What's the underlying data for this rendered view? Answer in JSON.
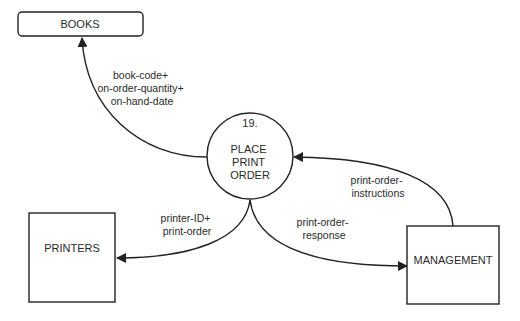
{
  "diagram": {
    "type": "data-flow-diagram",
    "process": {
      "number": "19.",
      "label_lines": [
        "PLACE",
        "PRINT",
        "ORDER"
      ]
    },
    "data_stores": [
      {
        "id": "books",
        "label": "BOOKS"
      }
    ],
    "external_entities": [
      {
        "id": "printers",
        "label": "PRINTERS"
      },
      {
        "id": "management",
        "label": "MANAGEMENT"
      }
    ],
    "flows": [
      {
        "id": "to-books",
        "from": "process-19",
        "to": "books",
        "label_lines": [
          "book-code+",
          "on-order-quantity+",
          "on-hand-date"
        ]
      },
      {
        "id": "to-printers",
        "from": "process-19",
        "to": "printers",
        "label_lines": [
          "printer-ID+",
          "print-order"
        ]
      },
      {
        "id": "to-management",
        "from": "process-19",
        "to": "management",
        "label_lines": [
          "print-order-",
          "response"
        ]
      },
      {
        "id": "from-management",
        "from": "management",
        "to": "process-19",
        "label_lines": [
          "print-order-",
          "instructions"
        ]
      }
    ],
    "colors": {
      "stroke": "#222222",
      "background": "#ffffff",
      "text": "#2a2a2a"
    }
  }
}
